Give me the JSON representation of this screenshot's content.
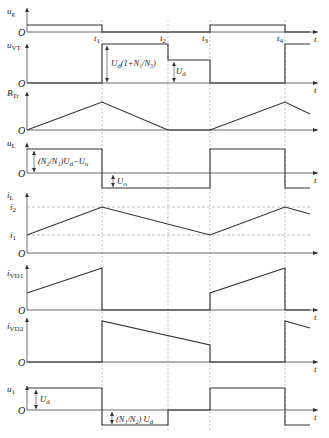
{
  "diagram": {
    "type": "timing-waveform",
    "axis_x": 27,
    "axis_end": 318,
    "time_markers": [
      {
        "name": "t1",
        "label": "t",
        "sub": "1",
        "x": 102
      },
      {
        "name": "t2",
        "label": "t",
        "sub": "2",
        "x": 168
      },
      {
        "name": "t3",
        "label": "t",
        "sub": "3",
        "x": 210
      },
      {
        "name": "t4",
        "label": "t",
        "sub": "4",
        "x": 285
      }
    ],
    "end_x": 310,
    "origin_label": "O",
    "time_label": "t",
    "panels": [
      {
        "name": "ug",
        "label": "u",
        "sub": "g",
        "label_y": 14,
        "axis_top": 8,
        "baseline": 32,
        "show_t": true,
        "points": [
          [
            27,
            25
          ],
          [
            102,
            25
          ],
          [
            102,
            32
          ],
          [
            210,
            32
          ],
          [
            210,
            25
          ],
          [
            285,
            25
          ],
          [
            285,
            32
          ],
          [
            310,
            32
          ]
        ]
      },
      {
        "name": "uVT",
        "label": "u",
        "sub": "VT",
        "label_y": 48,
        "axis_top": 44,
        "baseline": 83,
        "show_t": true,
        "points": [
          [
            27,
            83
          ],
          [
            102,
            83
          ],
          [
            102,
            44
          ],
          [
            168,
            44
          ],
          [
            168,
            60
          ],
          [
            210,
            60
          ],
          [
            210,
            83
          ],
          [
            285,
            83
          ],
          [
            285,
            44
          ],
          [
            310,
            44
          ]
        ],
        "annotations": [
          {
            "text": "U",
            "sub": "d",
            "suffix": "(1+N₁/N₃)",
            "x": 111,
            "y": 66,
            "arrow_x": 107,
            "y1": 46,
            "y2": 82
          },
          {
            "text": "U",
            "sub": "d",
            "suffix": "",
            "x": 176,
            "y": 74,
            "arrow_x": 174,
            "y1": 62,
            "y2": 82
          }
        ]
      },
      {
        "name": "BTr",
        "label": "B",
        "sub": "Tr",
        "label_y": 96,
        "axis_top": 92,
        "baseline": 130,
        "show_t": false,
        "points": [
          [
            27,
            130
          ],
          [
            102,
            102
          ],
          [
            168,
            130
          ],
          [
            210,
            130
          ],
          [
            285,
            102
          ],
          [
            310,
            114
          ]
        ]
      },
      {
        "name": "uL",
        "label": "u",
        "sub": "L",
        "label_y": 146,
        "axis_top": 143,
        "baseline": 173,
        "show_t": true,
        "points": [
          [
            27,
            149
          ],
          [
            102,
            149
          ],
          [
            102,
            188
          ],
          [
            210,
            188
          ],
          [
            210,
            149
          ],
          [
            285,
            149
          ],
          [
            285,
            188
          ],
          [
            310,
            188
          ]
        ],
        "annotations": [
          {
            "text": "(N₂/N₁)U",
            "sub": "d",
            "suffix": "−U",
            "sub2": "o",
            "x": 38,
            "y": 164,
            "arrow_x": 34,
            "y1": 151,
            "y2": 172
          },
          {
            "text": "U",
            "sub": "o",
            "suffix": "",
            "x": 117,
            "y": 184,
            "arrow_x": 113,
            "y1": 175,
            "y2": 187
          }
        ]
      },
      {
        "name": "iL",
        "label": "i",
        "sub": "L",
        "label_y": 198,
        "axis_top": 193,
        "baseline": 253,
        "show_t": false,
        "levels": [
          {
            "label": "i",
            "sub": "2",
            "y": 207
          },
          {
            "label": "i",
            "sub": "1",
            "y": 235
          }
        ],
        "points": [
          [
            27,
            235
          ],
          [
            102,
            207
          ],
          [
            210,
            235
          ],
          [
            285,
            207
          ],
          [
            310,
            214
          ]
        ]
      },
      {
        "name": "iVD1",
        "label": "i",
        "sub": "VD1",
        "label_y": 276,
        "axis_top": 265,
        "baseline": 310,
        "show_t": true,
        "points": [
          [
            27,
            293
          ],
          [
            102,
            268
          ],
          [
            102,
            310
          ],
          [
            210,
            310
          ],
          [
            210,
            293
          ],
          [
            285,
            268
          ],
          [
            285,
            310
          ],
          [
            310,
            310
          ]
        ]
      },
      {
        "name": "iVD2",
        "label": "i",
        "sub": "VD2",
        "label_y": 329,
        "axis_top": 318,
        "baseline": 362,
        "show_t": true,
        "points": [
          [
            27,
            362
          ],
          [
            102,
            362
          ],
          [
            102,
            321
          ],
          [
            210,
            345
          ],
          [
            210,
            362
          ],
          [
            285,
            362
          ],
          [
            285,
            321
          ],
          [
            310,
            328
          ]
        ]
      },
      {
        "name": "u1",
        "label": "u",
        "sub": "1",
        "label_y": 392,
        "axis_top": 386,
        "baseline": 410,
        "show_t": true,
        "points": [
          [
            27,
            388
          ],
          [
            102,
            388
          ],
          [
            102,
            425
          ],
          [
            168,
            425
          ],
          [
            168,
            410
          ],
          [
            210,
            410
          ],
          [
            210,
            388
          ],
          [
            285,
            388
          ],
          [
            285,
            425
          ],
          [
            310,
            425
          ]
        ],
        "annotations": [
          {
            "text": "U",
            "sub": "d",
            "suffix": "",
            "x": 40,
            "y": 402,
            "arrow_x": 36,
            "y1": 390,
            "y2": 409
          },
          {
            "text": "(N₁/N₂) U",
            "sub": "d",
            "suffix": "",
            "x": 116,
            "y": 422,
            "arrow_x": 112,
            "y1": 412,
            "y2": 424
          }
        ]
      }
    ]
  }
}
